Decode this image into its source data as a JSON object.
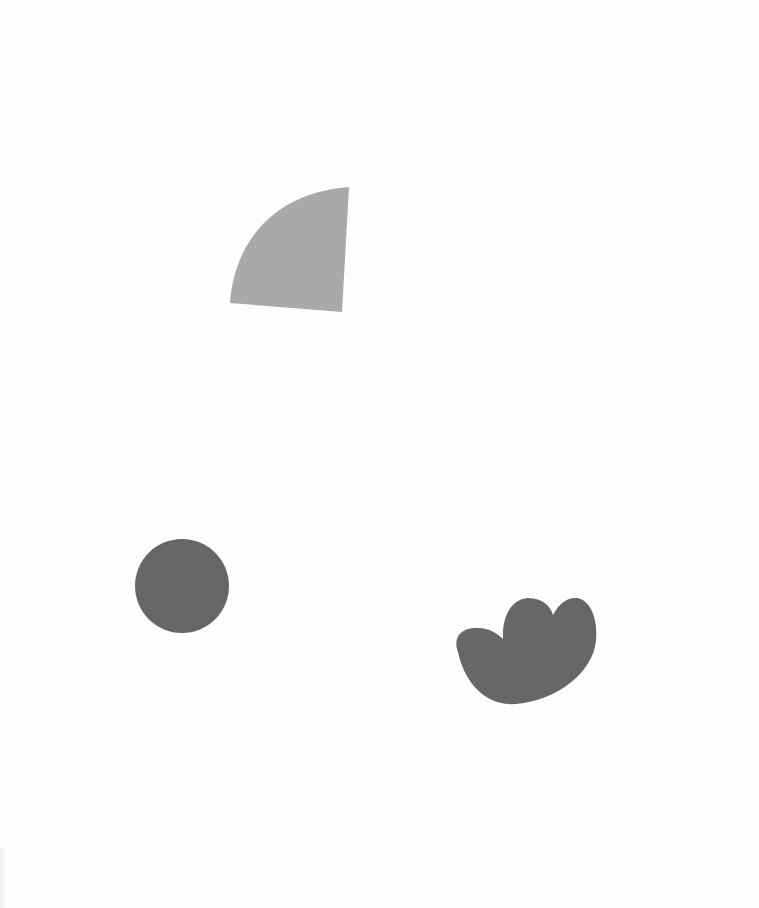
{
  "canvas": {
    "width": 759,
    "height": 908,
    "background": "#fefefe"
  },
  "shapes": [
    {
      "id": "wedge",
      "kind": "quarter-circle-wedge",
      "color": "#a9a9a9",
      "path": "M349,187 L342,312 L230,303 C233,255 262,194 349,187 Z"
    },
    {
      "id": "circle",
      "kind": "circle",
      "color": "#666666",
      "cx": 182,
      "cy": 586,
      "r": 47
    },
    {
      "id": "blob",
      "kind": "cloud-blob",
      "color": "#676767",
      "path": "M458,652 C452,636 463,628 475,628 C488,627 497,633 503,639 C502,615 512,599 528,598 C543,598 551,607 553,615 C559,603 568,597 577,598 C591,600 598,620 596,640 C594,670 560,700 516,704 C486,706 465,684 458,652 Z"
    }
  ]
}
